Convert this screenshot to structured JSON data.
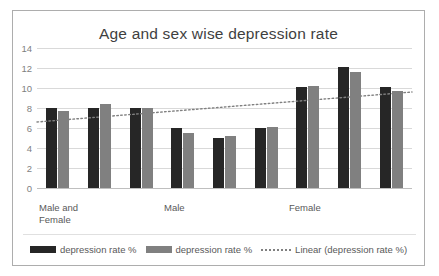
{
  "chart": {
    "title": "Age and sex wise depression rate",
    "frame_border_color": "#adadad",
    "background": "#ffffff"
  },
  "legend": {
    "items": [
      {
        "label": "depression rate %",
        "marker": "bar-swatch-dark",
        "color": "#262626"
      },
      {
        "label": "depression rate %",
        "marker": "bar-swatch-gray",
        "color": "#808080"
      },
      {
        "label": "Linear (depression rate %)",
        "marker": "dotted-line",
        "color": "#808080"
      }
    ]
  },
  "chart_data": {
    "type": "bar",
    "title": "Age and sex wise depression rate",
    "xlabel": "",
    "ylabel": "",
    "ylim": [
      0,
      14
    ],
    "yticks": [
      0,
      2,
      4,
      6,
      8,
      10,
      12,
      14
    ],
    "ytick_labels": [
      "0",
      "2",
      "4",
      "6",
      "8",
      "10",
      "12",
      "14"
    ],
    "grid": true,
    "legend_position": "bottom",
    "categories": [
      "Male and\nFemale",
      "",
      "",
      "Male",
      "",
      "",
      "Female",
      "",
      ""
    ],
    "category_axis_labels": [
      {
        "text": "Male and\nFemale",
        "group_index": 0
      },
      {
        "text": "Male",
        "group_index": 3
      },
      {
        "text": "Female",
        "group_index": 6
      }
    ],
    "series": [
      {
        "name": "depression rate %",
        "color": "#262626",
        "values": [
          8.0,
          8.0,
          8.05,
          6.05,
          5.0,
          6.05,
          10.1,
          12.1,
          10.1
        ]
      },
      {
        "name": "depression rate %",
        "color": "#808080",
        "values": [
          7.7,
          8.4,
          8.05,
          5.5,
          5.2,
          6.1,
          10.2,
          11.6,
          9.7
        ]
      }
    ],
    "trendline": {
      "name": "Linear (depression rate %)",
      "style": "dotted",
      "color": "#808080",
      "y_start": 6.6,
      "y_end": 9.6
    }
  }
}
